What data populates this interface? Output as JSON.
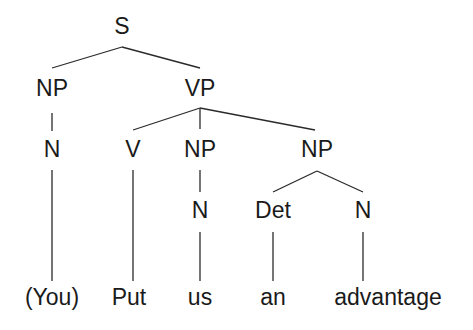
{
  "diagram": {
    "type": "syntax-tree",
    "nodes": {
      "s": "S",
      "np_subject": "NP",
      "vp": "VP",
      "n_subject": "N",
      "v": "V",
      "np_object1": "NP",
      "np_object2": "NP",
      "n_object1": "N",
      "det": "Det",
      "n_object2": "N"
    },
    "words": [
      "(You)",
      "Put",
      "us",
      "an",
      "advantage"
    ],
    "edges": [
      [
        "S",
        "NP"
      ],
      [
        "S",
        "VP"
      ],
      [
        "NP",
        "N"
      ],
      [
        "N",
        "(You)"
      ],
      [
        "VP",
        "V"
      ],
      [
        "VP",
        "NP"
      ],
      [
        "VP",
        "NP"
      ],
      [
        "V",
        "Put"
      ],
      [
        "NP",
        "N"
      ],
      [
        "N",
        "us"
      ],
      [
        "NP",
        "Det"
      ],
      [
        "NP",
        "N"
      ],
      [
        "Det",
        "an"
      ],
      [
        "N",
        "advantage"
      ]
    ],
    "colors": {
      "ink": "#1a1a1a",
      "background": "#ffffff"
    }
  }
}
